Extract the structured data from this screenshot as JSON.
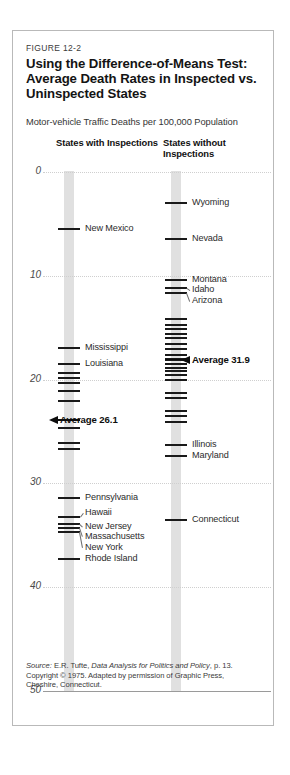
{
  "figure": {
    "number": "FIGURE 12-2",
    "title": "Using the Difference-of-Means Test: Average Death Rates in Inspected vs. Uninspected States",
    "subtitle": "Motor-vehicle Traffic Deaths per 100,000 Population"
  },
  "columns": {
    "left": {
      "header": "States with Inspections",
      "average_label": "Average 26.1",
      "average_value": 26.1
    },
    "right": {
      "header": "States without Inspections",
      "average_label": "Average 31.9",
      "average_value": 31.9
    }
  },
  "axis": {
    "ticks": [
      "50",
      "40",
      "30",
      "20",
      "10",
      "0"
    ],
    "values": [
      50,
      40,
      30,
      20,
      10,
      0
    ],
    "min": 0,
    "max": 50
  },
  "source": {
    "prefix": "Source:",
    "author": " E.R. Tufte, ",
    "work": "Data Analysis for Politics and Policy",
    "page": ", p. 13.",
    "copyright": "Copyright © 1975. Adapted by permission of Graphic Press, Cheshire, Connecticut."
  },
  "colors": {
    "bar": "#e0e0e0",
    "tick": "#1a1a1a",
    "grid": "#cfcfcf",
    "border": "#b9b9b9",
    "text": "#2b2b2b"
  },
  "chart_data": {
    "type": "scatter",
    "title": "Using the Difference-of-Means Test: Average Death Rates in Inspected vs. Uninspected States",
    "subtitle": "Motor-vehicle Traffic Deaths per 100,000 Population",
    "ylabel": "Motor-vehicle Traffic Deaths per 100,000 Population",
    "xlabel": "",
    "ylim": [
      0,
      50
    ],
    "yticks": [
      0,
      10,
      20,
      30,
      40,
      50
    ],
    "grid": true,
    "legend": "none",
    "series": [
      {
        "name": "States with Inspections",
        "mean": 26.1,
        "mean_label": "Average 26.1",
        "values": [
          44.5,
          33.0,
          31.5,
          30.6,
          30.2,
          29.7,
          28.9,
          27.9,
          26.1,
          25.3,
          23.9,
          23.3,
          18.6,
          16.8,
          16.1,
          15.7,
          15.3,
          12.7
        ],
        "labeled_points": [
          {
            "label": "New Mexico",
            "value": 44.5
          },
          {
            "label": "Mississippi",
            "value": 33.0
          },
          {
            "label": "Louisiana",
            "value": 31.5
          },
          {
            "label": "Pennsylvania",
            "value": 18.6
          },
          {
            "label": "Hawaii",
            "value": 16.8
          },
          {
            "label": "New Jersey",
            "value": 16.1
          },
          {
            "label": "Massachusetts",
            "value": 15.7
          },
          {
            "label": "New York",
            "value": 15.3
          },
          {
            "label": "Rhode Island",
            "value": 12.7
          }
        ]
      },
      {
        "name": "States without Inspections",
        "mean": 31.9,
        "mean_label": "Average 31.9",
        "values": [
          47.0,
          43.5,
          39.6,
          38.8,
          38.3,
          35.8,
          35.3,
          34.9,
          34.4,
          34.0,
          33.4,
          32.9,
          32.4,
          32.0,
          31.9,
          31.5,
          31.1,
          30.8,
          30.4,
          30.0,
          28.7,
          28.2,
          27.0,
          26.5,
          25.9,
          23.7,
          22.6,
          16.5
        ],
        "labeled_points": [
          {
            "label": "Wyoming",
            "value": 47.0
          },
          {
            "label": "Nevada",
            "value": 43.5
          },
          {
            "label": "Montana",
            "value": 39.6
          },
          {
            "label": "Idaho",
            "value": 38.8
          },
          {
            "label": "Arizona",
            "value": 38.3
          },
          {
            "label": "Illinois",
            "value": 23.7
          },
          {
            "label": "Maryland",
            "value": 22.6
          },
          {
            "label": "Connecticut",
            "value": 16.5
          }
        ]
      }
    ]
  }
}
